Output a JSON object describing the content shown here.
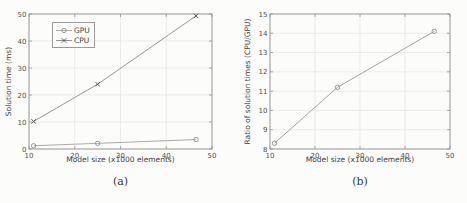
{
  "figure": {
    "background": "#fcfcfa",
    "captions": {
      "a": "(a)",
      "b": "(b)"
    }
  },
  "colors": {
    "frame": "#949494",
    "grid": "#e4e4e4",
    "tick_text": "#4f4f4f",
    "label_text": "#3f3f3f",
    "gpu_line": "#a2a2a2",
    "gpu_marker": "#8c8c8c",
    "cpu_line": "#8a8a8a",
    "cpu_marker": "#4a4a4a",
    "ratio_line": "#9a9a9a",
    "ratio_marker": "#8c8c8c"
  },
  "chart_data": [
    {
      "id": "a",
      "type": "line",
      "title": "",
      "xlabel": "Model size (x1000 elements)",
      "ylabel": "Solution time (ms)",
      "caption": "(a)",
      "xlim": [
        10,
        50
      ],
      "ylim": [
        0,
        50
      ],
      "xticks": [
        10,
        20,
        30,
        40,
        50
      ],
      "yticks": [
        0,
        10,
        20,
        30,
        40,
        50
      ],
      "grid": true,
      "legend_position": "upper-left",
      "x": [
        11,
        25,
        46.5
      ],
      "series": [
        {
          "name": "GPU",
          "marker": "circle",
          "line_color_key": "gpu_line",
          "marker_color_key": "gpu_marker",
          "values": [
            1.2,
            2.1,
            3.5
          ]
        },
        {
          "name": "CPU",
          "marker": "cross",
          "line_color_key": "cpu_line",
          "marker_color_key": "cpu_marker",
          "values": [
            10.2,
            24,
            49.3
          ]
        }
      ]
    },
    {
      "id": "b",
      "type": "line",
      "title": "",
      "xlabel": "Model size (x1000 elements)",
      "ylabel": "Ratio of solution times (CPU/GPU)",
      "caption": "(b)",
      "xlim": [
        10,
        50
      ],
      "ylim": [
        8,
        15
      ],
      "xticks": [
        10,
        20,
        30,
        40,
        50
      ],
      "yticks": [
        8,
        9,
        10,
        11,
        12,
        13,
        14,
        15
      ],
      "grid": true,
      "legend_position": null,
      "x": [
        11,
        25,
        46.5
      ],
      "series": [
        {
          "name": "CPU/GPU ratio",
          "marker": "circle",
          "line_color_key": "ratio_line",
          "marker_color_key": "ratio_marker",
          "values": [
            8.3,
            11.2,
            14.1
          ]
        }
      ]
    }
  ]
}
